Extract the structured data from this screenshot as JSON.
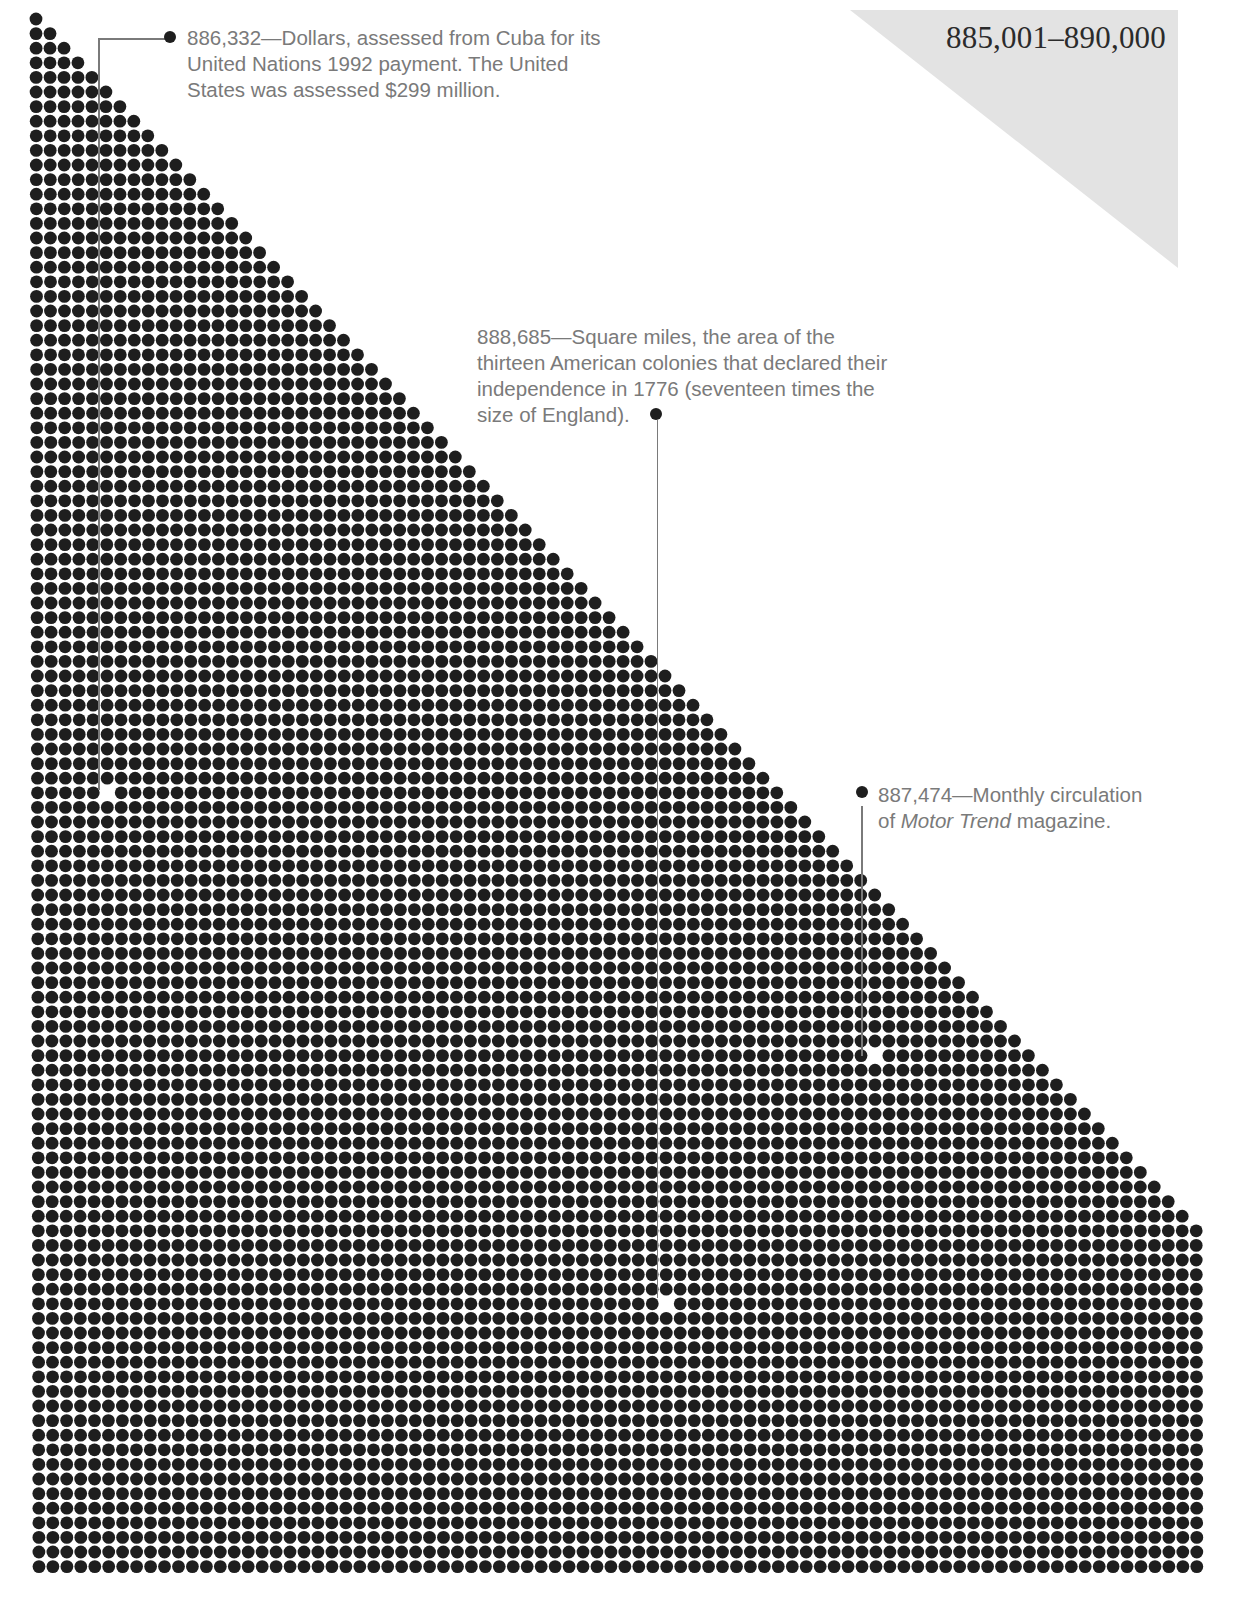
{
  "page": {
    "range_label": "885,001–890,000",
    "colors": {
      "dot": "#1e1e1e",
      "triangle": "#e3e3e3",
      "annotation_text": "#7a7a7a",
      "title_text": "#2b2b2b"
    }
  },
  "grid": {
    "columns": 84,
    "rows": 107,
    "origin_x": 36,
    "origin_y": 19,
    "pitch_x": 13.95,
    "pitch_y": 14.6,
    "dot_radius": 6.4,
    "staircase": "row r shows min(r+1, columns) dots"
  },
  "annotations": [
    {
      "value": "886,332",
      "text": "—Dollars, assessed from Cuba for its United Nations 1992 payment. The United States was assessed $299 million.",
      "lines": [
        "886,332—Dollars, assessed from Cuba for its",
        "United Nations 1992 payment. The United",
        "States was assessed $299 million."
      ],
      "hole": {
        "x": 107,
        "y": 789
      }
    },
    {
      "value": "888,685",
      "text": "—Square miles, the area of the thirteen American colonies that declared their independence in 1776 (seventeen times the size of England).",
      "lines": [
        "888,685—Square miles, the area of the",
        "thirteen American colonies that declared their",
        "independence in 1776 (seventeen times the",
        "size of England)."
      ],
      "hole": {
        "x": 666,
        "y": 1300
      }
    },
    {
      "value": "887,474",
      "text": "—Monthly circulation of Motor Trend magazine.",
      "lines": [
        "887,474—Monthly circulation",
        "of ",
        "Motor Trend",
        " magazine."
      ],
      "hole": {
        "x": 870,
        "y": 1057
      }
    }
  ]
}
